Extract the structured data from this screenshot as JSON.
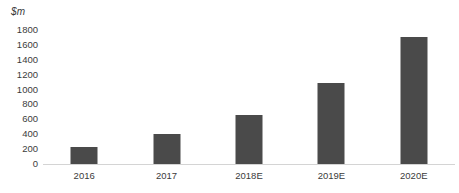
{
  "chart_data": {
    "type": "bar",
    "title": "",
    "subtitle": "",
    "xlabel": "",
    "ylabel": "$m",
    "categories": [
      "2016",
      "2017",
      "2018E",
      "2019E",
      "2020E"
    ],
    "values": [
      230,
      400,
      655,
      1090,
      1705
    ],
    "ylim": [
      0,
      1800
    ],
    "y_ticks": [
      0,
      200,
      400,
      600,
      800,
      1000,
      1200,
      1400,
      1600,
      1800
    ],
    "y_tick_labels": [
      "0",
      "200",
      "400",
      "600",
      "800",
      "1000",
      "1200",
      "1400",
      "1600",
      "1800"
    ],
    "grid": false,
    "legend": null,
    "legend_position": "none",
    "bar_color": "#4a4a4a",
    "axis_line_color": "#d4d4d4",
    "text_color": "#3b3b3b",
    "background_color": "#ffffff",
    "annotations": []
  }
}
